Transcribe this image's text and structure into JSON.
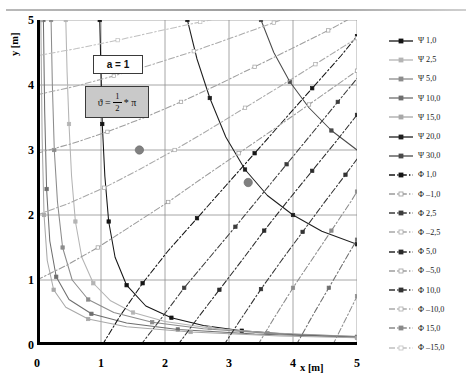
{
  "axes": {
    "x_label": "x [m]",
    "y_label": "y [m]",
    "x_ticks": [
      "0",
      "1",
      "2",
      "3",
      "4",
      "5"
    ],
    "y_ticks": [
      "0",
      "1",
      "2",
      "3",
      "4",
      "5"
    ]
  },
  "annotations": {
    "a_box": "a = 1",
    "theta_lhs": "ϑ =",
    "theta_num": "1",
    "theta_den": "2",
    "theta_rhs": "* π"
  },
  "corner_mark": "",
  "legend": {
    "entries": [
      {
        "label": "Ψ 1,0",
        "color": "#141414",
        "style": "solid",
        "marker": "filled"
      },
      {
        "label": "Ψ 2,5",
        "color": "#b4b4b4",
        "style": "solid",
        "marker": "filled"
      },
      {
        "label": "Ψ 5,0",
        "color": "#8c8c8c",
        "style": "solid",
        "marker": "filled"
      },
      {
        "label": "Ψ 10,0",
        "color": "#6e6e6e",
        "style": "solid",
        "marker": "filled"
      },
      {
        "label": "Ψ 15,0",
        "color": "#a8a8a8",
        "style": "solid",
        "marker": "filled"
      },
      {
        "label": "Ψ 20,0",
        "color": "#1e1e1e",
        "style": "solid",
        "marker": "filled"
      },
      {
        "label": "Ψ 30,0",
        "color": "#4a4a4a",
        "style": "solid",
        "marker": "filled"
      },
      {
        "label": "Φ 1,0",
        "color": "#141414",
        "style": "dashed",
        "marker": "filled"
      },
      {
        "label": "Φ –1,0",
        "color": "#9a9a9a",
        "style": "dashed",
        "marker": "open"
      },
      {
        "label": "Φ 2,5",
        "color": "#3c3c3c",
        "style": "dashed",
        "marker": "filled"
      },
      {
        "label": "Φ –2,5",
        "color": "#a8a8a8",
        "style": "dashed",
        "marker": "open"
      },
      {
        "label": "Φ 5,0",
        "color": "#2a2a2a",
        "style": "dashed",
        "marker": "filled"
      },
      {
        "label": "Φ –5,0",
        "color": "#9e9e9e",
        "style": "dashed",
        "marker": "open"
      },
      {
        "label": "Φ 10,0",
        "color": "#333333",
        "style": "dashed",
        "marker": "filled"
      },
      {
        "label": "Φ –10,0",
        "color": "#ababab",
        "style": "dashed",
        "marker": "open"
      },
      {
        "label": "Φ 15,0",
        "color": "#8a8a8a",
        "style": "dashed",
        "marker": "filled"
      },
      {
        "label": "Φ –15,0",
        "color": "#c0c0c0",
        "style": "dashed",
        "marker": "open"
      }
    ]
  },
  "chart_data": {
    "type": "line",
    "title": "",
    "xlabel": "x [m]",
    "ylabel": "y [m]",
    "xlim": [
      0,
      5
    ],
    "ylim": [
      0,
      5
    ],
    "grid": true,
    "legend_position": "right",
    "parameters": {
      "a": 1,
      "theta": "0.5*pi"
    },
    "highlight_points": [
      {
        "x": 1.6,
        "y": 3.0,
        "color": "#808080"
      },
      {
        "x": 3.3,
        "y": 2.5,
        "color": "#808080"
      }
    ],
    "series": [
      {
        "name": "Ψ 1,0",
        "kind": "streamline",
        "value": 1.0,
        "color": "#141414",
        "style": "solid",
        "points": [
          [
            0.98,
            5.0
          ],
          [
            1.0,
            4.2
          ],
          [
            1.02,
            3.4
          ],
          [
            1.06,
            2.6
          ],
          [
            1.12,
            1.9
          ],
          [
            1.22,
            1.35
          ],
          [
            1.4,
            0.92
          ],
          [
            1.7,
            0.6
          ],
          [
            2.1,
            0.42
          ],
          [
            2.6,
            0.3
          ],
          [
            3.2,
            0.22
          ],
          [
            4.0,
            0.16
          ],
          [
            5.0,
            0.12
          ]
        ]
      },
      {
        "name": "Ψ 2,5",
        "kind": "streamline",
        "value": 2.5,
        "color": "#b4b4b4",
        "style": "solid",
        "points": [
          [
            0.45,
            5.0
          ],
          [
            0.47,
            4.2
          ],
          [
            0.5,
            3.4
          ],
          [
            0.54,
            2.6
          ],
          [
            0.6,
            1.9
          ],
          [
            0.7,
            1.35
          ],
          [
            0.88,
            0.95
          ],
          [
            1.15,
            0.68
          ],
          [
            1.5,
            0.5
          ],
          [
            2.0,
            0.36
          ],
          [
            2.7,
            0.26
          ],
          [
            3.6,
            0.19
          ],
          [
            5.0,
            0.13
          ]
        ]
      },
      {
        "name": "Ψ 5,0",
        "kind": "streamline",
        "value": 5.0,
        "color": "#8c8c8c",
        "style": "solid",
        "points": [
          [
            0.22,
            5.0
          ],
          [
            0.24,
            4.0
          ],
          [
            0.27,
            3.0
          ],
          [
            0.32,
            2.2
          ],
          [
            0.4,
            1.5
          ],
          [
            0.55,
            1.0
          ],
          [
            0.8,
            0.7
          ],
          [
            1.2,
            0.5
          ],
          [
            1.8,
            0.35
          ],
          [
            2.6,
            0.25
          ],
          [
            3.6,
            0.18
          ],
          [
            5.0,
            0.13
          ]
        ]
      },
      {
        "name": "Ψ 10,0",
        "kind": "streamline",
        "value": 10.0,
        "color": "#6e6e6e",
        "style": "solid",
        "points": [
          [
            0.1,
            5.0
          ],
          [
            0.12,
            3.6
          ],
          [
            0.15,
            2.4
          ],
          [
            0.2,
            1.6
          ],
          [
            0.3,
            1.05
          ],
          [
            0.5,
            0.7
          ],
          [
            0.85,
            0.48
          ],
          [
            1.4,
            0.34
          ],
          [
            2.2,
            0.24
          ],
          [
            3.4,
            0.17
          ],
          [
            5.0,
            0.12
          ]
        ]
      },
      {
        "name": "Ψ 15,0",
        "kind": "streamline",
        "value": 15.0,
        "color": "#a8a8a8",
        "style": "solid",
        "points": [
          [
            0.06,
            5.0
          ],
          [
            0.08,
            3.2
          ],
          [
            0.11,
            2.0
          ],
          [
            0.16,
            1.3
          ],
          [
            0.26,
            0.85
          ],
          [
            0.45,
            0.58
          ],
          [
            0.8,
            0.4
          ],
          [
            1.4,
            0.28
          ],
          [
            2.4,
            0.2
          ],
          [
            3.8,
            0.14
          ],
          [
            5.0,
            0.11
          ]
        ]
      },
      {
        "name": "Ψ 20,0",
        "kind": "streamline",
        "value": 20.0,
        "color": "#1e1e1e",
        "style": "solid",
        "points": [
          [
            2.35,
            5.0
          ],
          [
            2.5,
            4.4
          ],
          [
            2.7,
            3.8
          ],
          [
            2.95,
            3.2
          ],
          [
            3.25,
            2.7
          ],
          [
            3.6,
            2.3
          ],
          [
            4.0,
            2.0
          ],
          [
            4.45,
            1.75
          ],
          [
            5.0,
            1.55
          ]
        ]
      },
      {
        "name": "Ψ 30,0",
        "kind": "streamline",
        "value": 30.0,
        "color": "#4a4a4a",
        "style": "solid",
        "points": [
          [
            3.5,
            5.0
          ],
          [
            3.7,
            4.5
          ],
          [
            3.95,
            4.05
          ],
          [
            4.25,
            3.65
          ],
          [
            4.6,
            3.3
          ],
          [
            5.0,
            3.0
          ]
        ]
      },
      {
        "name": "Φ 1,0",
        "kind": "equipotential",
        "value": 1.0,
        "color": "#141414",
        "style": "dashed",
        "points": [
          [
            1.02,
            0.0
          ],
          [
            1.3,
            0.45
          ],
          [
            1.65,
            0.95
          ],
          [
            2.05,
            1.45
          ],
          [
            2.5,
            1.95
          ],
          [
            2.95,
            2.45
          ],
          [
            3.4,
            2.95
          ],
          [
            3.85,
            3.45
          ],
          [
            4.3,
            3.95
          ],
          [
            4.75,
            4.45
          ],
          [
            5.0,
            4.75
          ]
        ]
      },
      {
        "name": "Φ –1,0",
        "kind": "equipotential",
        "value": -1.0,
        "color": "#9a9a9a",
        "style": "dashed",
        "points": [
          [
            0.0,
            1.0
          ],
          [
            0.45,
            1.22
          ],
          [
            0.95,
            1.5
          ],
          [
            1.5,
            1.85
          ],
          [
            2.05,
            2.2
          ],
          [
            2.6,
            2.58
          ],
          [
            3.15,
            2.95
          ],
          [
            3.7,
            3.32
          ],
          [
            4.25,
            3.7
          ],
          [
            4.8,
            4.08
          ],
          [
            5.0,
            4.22
          ]
        ]
      },
      {
        "name": "Φ 2,5",
        "kind": "equipotential",
        "value": 2.5,
        "color": "#3c3c3c",
        "style": "dashed",
        "points": [
          [
            1.62,
            0.0
          ],
          [
            1.95,
            0.42
          ],
          [
            2.3,
            0.88
          ],
          [
            2.7,
            1.35
          ],
          [
            3.1,
            1.82
          ],
          [
            3.5,
            2.3
          ],
          [
            3.9,
            2.78
          ],
          [
            4.3,
            3.26
          ],
          [
            4.7,
            3.74
          ],
          [
            5.0,
            4.1
          ]
        ]
      },
      {
        "name": "Φ –2,5",
        "kind": "equipotential",
        "value": -2.5,
        "color": "#a8a8a8",
        "style": "dashed",
        "points": [
          [
            0.0,
            2.0
          ],
          [
            0.5,
            2.18
          ],
          [
            1.05,
            2.42
          ],
          [
            1.6,
            2.7
          ],
          [
            2.15,
            3.0
          ],
          [
            2.7,
            3.32
          ],
          [
            3.25,
            3.65
          ],
          [
            3.8,
            3.98
          ],
          [
            4.35,
            4.32
          ],
          [
            4.9,
            4.66
          ],
          [
            5.0,
            4.72
          ]
        ]
      },
      {
        "name": "Φ 5,0",
        "kind": "equipotential",
        "value": 5.0,
        "color": "#2a2a2a",
        "style": "dashed",
        "points": [
          [
            2.2,
            0.0
          ],
          [
            2.5,
            0.4
          ],
          [
            2.85,
            0.85
          ],
          [
            3.2,
            1.3
          ],
          [
            3.55,
            1.76
          ],
          [
            3.92,
            2.22
          ],
          [
            4.3,
            2.68
          ],
          [
            4.68,
            3.14
          ],
          [
            5.0,
            3.54
          ]
        ]
      },
      {
        "name": "Φ –5,0",
        "kind": "equipotential",
        "value": -5.0,
        "color": "#9e9e9e",
        "style": "dashed",
        "points": [
          [
            0.0,
            2.95
          ],
          [
            0.55,
            3.1
          ],
          [
            1.1,
            3.28
          ],
          [
            1.68,
            3.5
          ],
          [
            2.25,
            3.74
          ],
          [
            2.82,
            4.0
          ],
          [
            3.4,
            4.28
          ],
          [
            3.98,
            4.56
          ],
          [
            4.55,
            4.84
          ],
          [
            4.85,
            5.0
          ]
        ]
      },
      {
        "name": "Φ 10,0",
        "kind": "equipotential",
        "value": 10.0,
        "color": "#333333",
        "style": "dashed",
        "points": [
          [
            2.92,
            0.0
          ],
          [
            3.2,
            0.42
          ],
          [
            3.5,
            0.86
          ],
          [
            3.82,
            1.3
          ],
          [
            4.15,
            1.74
          ],
          [
            4.48,
            2.18
          ],
          [
            4.82,
            2.62
          ],
          [
            5.0,
            2.86
          ]
        ]
      },
      {
        "name": "Φ –10,0",
        "kind": "equipotential",
        "value": -10.0,
        "color": "#ababab",
        "style": "dashed",
        "points": [
          [
            0.0,
            3.85
          ],
          [
            0.6,
            3.98
          ],
          [
            1.2,
            4.14
          ],
          [
            1.82,
            4.32
          ],
          [
            2.45,
            4.52
          ],
          [
            3.08,
            4.74
          ],
          [
            3.7,
            4.96
          ],
          [
            3.82,
            5.0
          ]
        ]
      },
      {
        "name": "Φ 15,0",
        "kind": "equipotential",
        "value": 15.0,
        "color": "#8a8a8a",
        "style": "dashed",
        "points": [
          [
            3.45,
            0.0
          ],
          [
            3.72,
            0.44
          ],
          [
            4.0,
            0.88
          ],
          [
            4.3,
            1.32
          ],
          [
            4.6,
            1.76
          ],
          [
            4.9,
            2.2
          ],
          [
            5.0,
            2.36
          ]
        ]
      },
      {
        "name": "Φ –15,0",
        "kind": "equipotential",
        "value": -15.0,
        "color": "#c0c0c0",
        "style": "dashed",
        "points": [
          [
            0.0,
            4.45
          ],
          [
            0.62,
            4.56
          ],
          [
            1.26,
            4.69
          ],
          [
            1.9,
            4.83
          ],
          [
            2.55,
            4.97
          ],
          [
            2.72,
            5.0
          ]
        ]
      },
      {
        "name": "Φ extra-a",
        "kind": "equipotential",
        "value": null,
        "color": "#6d6d6d",
        "style": "dashed",
        "points": [
          [
            4.05,
            0.0
          ],
          [
            4.3,
            0.44
          ],
          [
            4.56,
            0.88
          ],
          [
            4.82,
            1.32
          ],
          [
            5.0,
            1.62
          ]
        ]
      },
      {
        "name": "Φ extra-b",
        "kind": "equipotential",
        "value": null,
        "color": "#8f8f8f",
        "style": "dashed",
        "points": [
          [
            4.62,
            0.0
          ],
          [
            4.85,
            0.45
          ],
          [
            5.0,
            0.75
          ]
        ]
      }
    ]
  }
}
